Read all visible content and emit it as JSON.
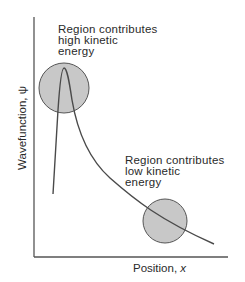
{
  "diagram": {
    "title": "",
    "axes": {
      "x_label_text": "Position, ",
      "x_label_var": "x",
      "y_label": "Wavefunction, ψ"
    },
    "annotations": [
      {
        "id": "high",
        "lines": [
          "Region contributes",
          "high kinetic",
          "energy"
        ]
      },
      {
        "id": "low",
        "lines": [
          "Region contributes",
          "low kinetic",
          "energy"
        ]
      }
    ],
    "colors": {
      "line": "#4a4a4a",
      "circle_fill": "#c8c8c8",
      "circle_stroke": "#555555",
      "axis": "#555555"
    }
  }
}
